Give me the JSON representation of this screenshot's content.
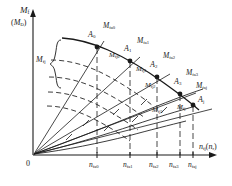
{
  "figure": {
    "type": "engineering-characteristic-curve-diagram",
    "background_color": "#ffffff",
    "line_color": "#1a1a1a",
    "axes": {
      "y_label_main": "M",
      "y_label_main_sub": "f",
      "y_label_alt": "(M",
      "y_label_alt_sub": "D",
      "y_label_alt_close": ")",
      "x_label": "n",
      "x_label_sub": "fj",
      "x_label_paren": "(n",
      "x_label_paren_sub": "r",
      "x_label_paren_close": ")",
      "origin_label": "0"
    },
    "bracket_label": {
      "text": "M",
      "sub": "fj"
    },
    "envelope_points": [
      {
        "name": "A",
        "sub": "0",
        "x": 97,
        "y": 46
      },
      {
        "name": "A",
        "sub": "1",
        "x": 130,
        "y": 60
      },
      {
        "name": "A",
        "sub": "2",
        "x": 157,
        "y": 75
      },
      {
        "name": "A",
        "sub": "3",
        "x": 180,
        "y": 92
      },
      {
        "name": "A",
        "sub": "j",
        "x": 196,
        "y": 106
      }
    ],
    "point_labels": [
      {
        "text": "A",
        "sub": "0",
        "x": 88,
        "y": 36
      },
      {
        "text": "A",
        "sub": "1",
        "x": 124,
        "y": 49
      },
      {
        "text": "A",
        "sub": "2",
        "x": 150,
        "y": 64
      },
      {
        "text": "A",
        "sub": "3",
        "x": 174,
        "y": 82
      },
      {
        "text": "A",
        "sub": "j",
        "x": 199,
        "y": 100
      }
    ],
    "moment_labels_upper": [
      {
        "text": "M",
        "sub": "fa0",
        "x": 104,
        "y": 28
      },
      {
        "text": "M",
        "sub": "fa1",
        "x": 138,
        "y": 42
      },
      {
        "text": "M",
        "sub": "fa2",
        "x": 164,
        "y": 57
      },
      {
        "text": "M",
        "sub": "fa3",
        "x": 187,
        "y": 74
      },
      {
        "text": "M",
        "sub": "faj",
        "x": 196,
        "y": 86
      }
    ],
    "moment_labels_inner": [
      {
        "text": "M",
        "sub": "fj0",
        "x": 111,
        "y": 57
      },
      {
        "text": "M",
        "sub": "fj1",
        "x": 138,
        "y": 71
      },
      {
        "text": "M",
        "sub": "fj2",
        "x": 147,
        "y": 86
      },
      {
        "text": "M",
        "sub": "fj3",
        "x": 155,
        "y": 110
      },
      {
        "text": "M",
        "sub": "fj",
        "x": 178,
        "y": 108
      }
    ],
    "x_tick_labels": [
      {
        "text": "n",
        "sub": "fa0",
        "x": 91,
        "y": 164
      },
      {
        "text": "n",
        "sub": "fa1",
        "x": 126,
        "y": 164
      },
      {
        "text": "n",
        "sub": "fa2",
        "x": 152,
        "y": 164
      },
      {
        "text": "n",
        "sub": "fa3",
        "x": 172,
        "y": 164
      },
      {
        "text": "n",
        "sub": "faj",
        "x": 189,
        "y": 164
      }
    ],
    "x_tick_positions": [
      97,
      130,
      157,
      180,
      193
    ],
    "radial_line_count": 5,
    "dashed_curve_count": 4
  }
}
